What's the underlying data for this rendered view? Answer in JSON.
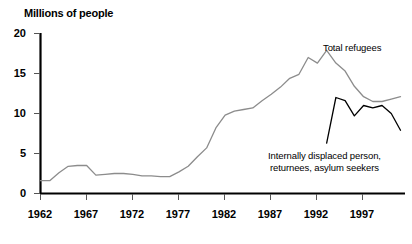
{
  "chart_data": {
    "type": "line",
    "title": "Millions of people",
    "xlabel": "",
    "ylabel": "Millions of people",
    "xlim": [
      1962,
      2001
    ],
    "ylim": [
      0,
      20
    ],
    "grid": false,
    "legend_position": "inline-annotations",
    "y_ticks": [
      0,
      5,
      10,
      15,
      20
    ],
    "y_tick_labels": [
      "0",
      "5",
      "10",
      "15",
      "20"
    ],
    "x_ticks": [
      1962,
      1967,
      1972,
      1977,
      1982,
      1987,
      1992,
      1997
    ],
    "x_tick_labels": [
      "1962",
      "1967",
      "1972",
      "1977",
      "1982",
      "1987",
      "1992",
      "1997"
    ],
    "series": [
      {
        "name": "Total refugees",
        "color": "#8c8c8c",
        "annotation": "Total refugees",
        "x": [
          1962,
          1963,
          1964,
          1965,
          1966,
          1967,
          1968,
          1969,
          1970,
          1971,
          1972,
          1973,
          1974,
          1975,
          1976,
          1977,
          1978,
          1979,
          1980,
          1981,
          1982,
          1983,
          1984,
          1985,
          1986,
          1987,
          1988,
          1989,
          1990,
          1991,
          1992,
          1993,
          1994,
          1995,
          1996,
          1997,
          1998,
          1999,
          2000,
          2001
        ],
        "values": [
          1.6,
          1.6,
          2.6,
          3.4,
          3.5,
          3.5,
          2.3,
          2.4,
          2.5,
          2.5,
          2.4,
          2.2,
          2.2,
          2.1,
          2.1,
          2.7,
          3.4,
          4.6,
          5.7,
          8.2,
          9.8,
          10.3,
          10.5,
          10.7,
          11.6,
          12.4,
          13.3,
          14.4,
          14.9,
          17.0,
          16.3,
          17.9,
          16.3,
          15.3,
          13.4,
          12.1,
          11.5,
          11.5,
          11.8,
          12.1
        ]
      },
      {
        "name": "Internally displaced person, returnees, asylum seekers",
        "color": "#000000",
        "annotation_line1": "Internally displaced person,",
        "annotation_line2": "returnees, asylum seekers",
        "x": [
          1993,
          1994,
          1995,
          1996,
          1997,
          1998,
          1999,
          2000,
          2001
        ],
        "values": [
          6.3,
          12.0,
          11.6,
          9.7,
          11.0,
          10.7,
          11.0,
          10.0,
          7.9
        ]
      }
    ]
  },
  "axis": {
    "y_axis_title": "Millions of people"
  }
}
